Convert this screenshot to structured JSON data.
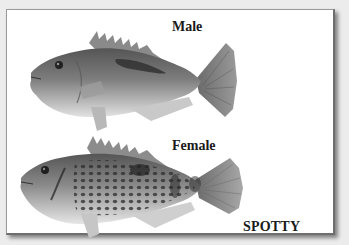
{
  "card": {
    "labels": {
      "male": "Male",
      "female": "Female",
      "species": "SPOTTY"
    }
  },
  "figures": [
    {
      "id": "male-fish",
      "description": "grayscale illustration of male spotty wrasse, darker dorsal stripe"
    },
    {
      "id": "female-fish",
      "description": "grayscale illustration of female spotty wrasse, covered in dark spots"
    }
  ],
  "colors": {
    "background": "#ececec",
    "card": "#ffffff",
    "border": "#6e6e6e",
    "text": "#1a1a1a"
  }
}
